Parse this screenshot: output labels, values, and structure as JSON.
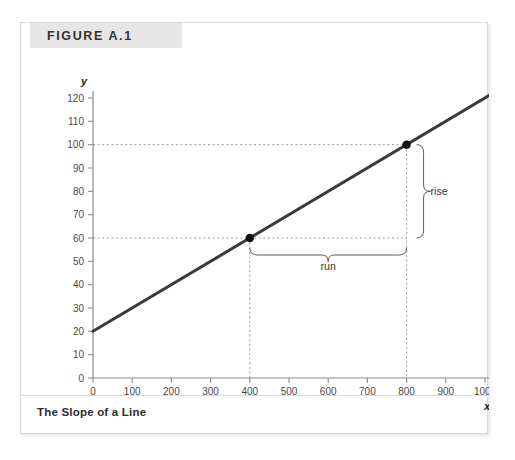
{
  "figure": {
    "label": "FIGURE A.1",
    "caption": "The Slope of a Line"
  },
  "chart_data": {
    "type": "line",
    "title": "The Slope of a Line",
    "xlabel": "x",
    "ylabel": "y",
    "xlim": [
      0,
      1030
    ],
    "ylim": [
      0,
      125
    ],
    "grid": false,
    "legend": null,
    "series": [
      {
        "name": "line",
        "equation": "y = 20 + 0.1x",
        "slope": 0.1,
        "intercept": 20,
        "x": [
          0,
          1030
        ],
        "values": [
          20,
          123
        ],
        "color": "#3a3a3a"
      }
    ],
    "points": [
      {
        "label": "point-1",
        "x": 400,
        "y": 60
      },
      {
        "label": "point-2",
        "x": 800,
        "y": 100
      }
    ],
    "annotations": [
      {
        "name": "rise",
        "text": "rise",
        "orientation": "vertical",
        "from": 60,
        "to": 100,
        "at_x": 800,
        "value": 40
      },
      {
        "name": "run",
        "text": "run",
        "orientation": "horizontal",
        "from": 400,
        "to": 800,
        "at_y": 60,
        "value": 400
      }
    ],
    "x_ticks": [
      0,
      100,
      200,
      300,
      400,
      500,
      600,
      700,
      800,
      900,
      1000
    ],
    "y_ticks": [
      0,
      10,
      20,
      30,
      40,
      50,
      60,
      70,
      80,
      90,
      100,
      110,
      120
    ],
    "x_tick_labels": [
      "0",
      "100",
      "200",
      "300",
      "400",
      "500",
      "600",
      "700",
      "800",
      "900",
      "1000"
    ],
    "y_tick_labels": [
      "0",
      "10",
      "20",
      "30",
      "40",
      "50",
      "60",
      "70",
      "80",
      "90",
      "100",
      "110",
      "120"
    ],
    "guide_lines": [
      {
        "type": "horizontal",
        "y": 60
      },
      {
        "type": "horizontal",
        "y": 100
      },
      {
        "type": "vertical",
        "x": 400
      },
      {
        "type": "vertical",
        "x": 800
      }
    ]
  },
  "colors": {
    "line": "#3a3a3a",
    "axis": "#8c8c8c",
    "guide": "#9a9a9a",
    "header_band": "#e6e6e6",
    "panel_border": "#d8d8d8"
  }
}
